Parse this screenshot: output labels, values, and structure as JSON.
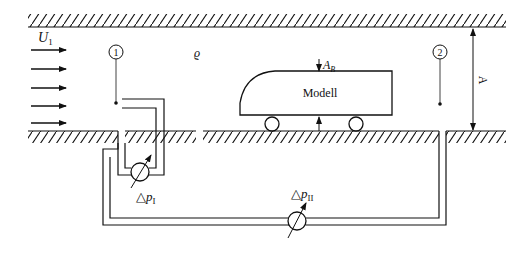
{
  "diagram": {
    "type": "wind-tunnel-measurement-setup",
    "labels": {
      "flow_velocity": "U",
      "flow_velocity_sub": "1",
      "density": "ϱ",
      "station_1": "1",
      "station_2": "2",
      "model": "Modell",
      "area": "A",
      "area_sub": "B",
      "height": "A",
      "dp1_symbol": "△",
      "dp1_var": "p",
      "dp1_sub": "I",
      "dp2_symbol": "△",
      "dp2_var": "p",
      "dp2_sub": "II"
    },
    "colors": {
      "line": "#111111",
      "background": "#ffffff"
    }
  }
}
